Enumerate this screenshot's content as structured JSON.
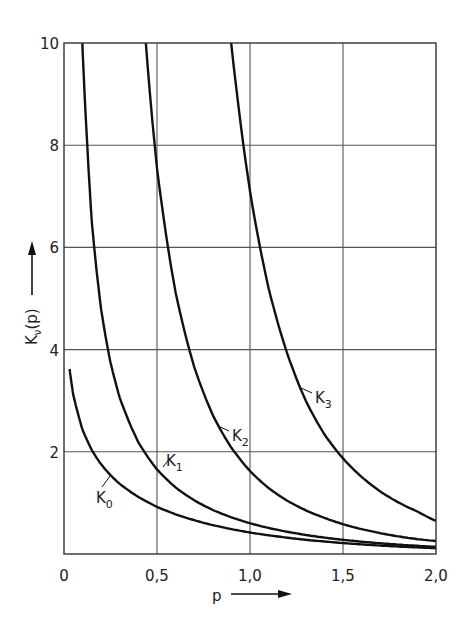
{
  "chart_data": {
    "type": "line",
    "title": "",
    "xlabel": "p",
    "ylabel": "K_ν(p)",
    "ylabel_base": "K",
    "ylabel_sub": "ν",
    "ylabel_arg": "(p)",
    "xlim": [
      0,
      2.0
    ],
    "ylim": [
      0,
      10
    ],
    "grid": true,
    "x_ticks": [
      0,
      0.5,
      1.0,
      1.5,
      2.0
    ],
    "x_tick_labels": [
      "0",
      "0,5",
      "1,0",
      "1,5",
      "2,0"
    ],
    "y_ticks": [
      2,
      4,
      6,
      8,
      10
    ],
    "y_tick_labels": [
      "2",
      "4",
      "6",
      "8",
      "10"
    ],
    "x": [
      0.03,
      0.05,
      0.1,
      0.15,
      0.2,
      0.25,
      0.3,
      0.4,
      0.5,
      0.6,
      0.7,
      0.8,
      0.9,
      1.0,
      1.1,
      1.2,
      1.3,
      1.4,
      1.5,
      1.6,
      1.7,
      1.8,
      1.9,
      2.0
    ],
    "series": [
      {
        "name": "K0",
        "label_base": "K",
        "label_sub": "0",
        "values": [
          3.62,
          3.11,
          2.427,
          2.03,
          1.753,
          1.542,
          1.372,
          1.115,
          0.924,
          0.777,
          0.661,
          0.565,
          0.487,
          0.421,
          0.366,
          0.319,
          0.278,
          0.244,
          0.214,
          0.188,
          0.165,
          0.146,
          0.129,
          0.114
        ]
      },
      {
        "name": "K1",
        "label_base": "K",
        "label_sub": "1",
        "values": [
          33.3,
          19.91,
          9.854,
          6.477,
          4.776,
          3.747,
          3.056,
          2.184,
          1.656,
          1.303,
          1.051,
          0.862,
          0.717,
          0.602,
          0.51,
          0.435,
          0.372,
          0.321,
          0.277,
          0.241,
          0.209,
          0.183,
          0.16,
          0.14
        ]
      },
      {
        "name": "K2",
        "label_base": "K",
        "label_sub": "2",
        "values": [
          2222,
          799.5,
          199.5,
          88.36,
          49.51,
          31.51,
          21.75,
          12.04,
          7.55,
          5.12,
          3.664,
          2.719,
          2.079,
          1.625,
          1.292,
          1.044,
          0.8548,
          0.7067,
          0.5836,
          0.4867,
          0.4078,
          0.3437,
          0.2905,
          0.2538
        ]
      },
      {
        "name": "K3",
        "label_base": "K",
        "label_sub": "3",
        "values": [
          296000,
          64000,
          7990,
          2363,
          995.4,
          507.5,
          293.0,
          122.5,
          62.06,
          35.44,
          21.99,
          14.46,
          9.958,
          7.101,
          5.2,
          3.924,
          3.0,
          2.343,
          1.87,
          1.508,
          1.226,
          1.005,
          0.8315,
          0.6474
        ]
      }
    ]
  }
}
